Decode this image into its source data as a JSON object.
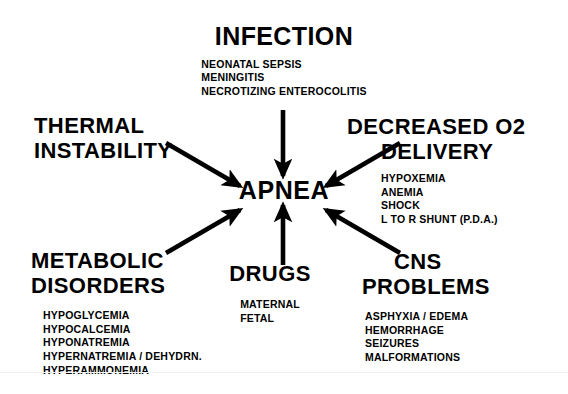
{
  "diagram": {
    "center": {
      "label": "APNEA"
    },
    "nodes": [
      {
        "id": "infection",
        "heading_line1": "INFECTION",
        "items": [
          "NEONATAL  SEPSIS",
          "MENINGITIS",
          "NECROTIZING  ENTEROCOLITIS"
        ]
      },
      {
        "id": "thermal",
        "heading_line1": "THERMAL",
        "heading_line2": "INSTABILITY",
        "items": []
      },
      {
        "id": "decreased_o2",
        "heading_line1": "DECREASED  O2",
        "heading_line2": "DELIVERY",
        "items": [
          "HYPOXEMIA",
          "ANEMIA",
          "SHOCK",
          "L  TO  R  SHUNT  (P.D.A.)"
        ]
      },
      {
        "id": "metabolic",
        "heading_line1": "METABOLIC",
        "heading_line2": "DISORDERS",
        "items": [
          "HYPOGLYCEMIA",
          "HYPOCALCEMIA",
          "HYPONATREMIA",
          "HYPERNATREMIA  /  DEHYDRN.",
          "HYPERAMMONEMIA"
        ]
      },
      {
        "id": "drugs",
        "heading_line1": "DRUGS",
        "items": [
          "MATERNAL",
          "FETAL"
        ]
      },
      {
        "id": "cns",
        "heading_line1": "CNS",
        "heading_line2": "PROBLEMS",
        "items": [
          "ASPHYXIA  /  EDEMA",
          "HEMORRHAGE",
          "SEIZURES",
          "MALFORMATIONS"
        ]
      }
    ],
    "colors": {
      "ink": "#000000",
      "background": "#ffffff"
    }
  }
}
